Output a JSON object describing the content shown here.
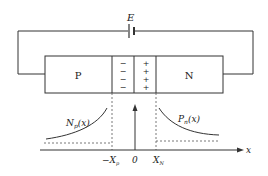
{
  "diagram": {
    "title": "",
    "battery": {
      "label": "E"
    },
    "regions": {
      "p_label": "P",
      "n_label": "N",
      "depletion_negative": [
        "−",
        "−",
        "−",
        "−"
      ],
      "depletion_positive": [
        "+",
        "+",
        "+",
        "+"
      ]
    },
    "curves": {
      "left_label_main": "N",
      "left_label_sub": "p",
      "left_label_arg": "(x)",
      "right_label_main": "P",
      "right_label_sub": "n",
      "right_label_arg": "(x)"
    },
    "axis": {
      "x_label": "x",
      "ticks": {
        "neg_xp_main": "−X",
        "neg_xp_sub": "p",
        "zero": "0",
        "xn_main": "X",
        "xn_sub": "N"
      }
    },
    "colors": {
      "line": "#333333",
      "background": "#ffffff"
    }
  }
}
